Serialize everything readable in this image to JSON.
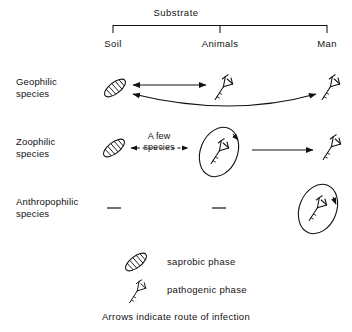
{
  "figure": {
    "title": "Substrate",
    "columns": [
      {
        "id": "soil",
        "label": "Soil"
      },
      {
        "id": "animals",
        "label": "Animals"
      },
      {
        "id": "man",
        "label": "Man"
      }
    ],
    "rows": [
      {
        "id": "geophilic",
        "label": "Geophilic\nspecies",
        "cells": [
          {
            "column": "soil",
            "icon": "saprobic-phase-icon"
          },
          {
            "column": "animals",
            "icon": "pathogenic-phase-icon"
          },
          {
            "column": "man",
            "icon": "pathogenic-phase-icon"
          }
        ],
        "arrows": [
          {
            "from": "soil",
            "to": "animals",
            "style": "solid",
            "heads": "both",
            "shape": "straight"
          },
          {
            "from": "soil",
            "to": "man",
            "style": "solid",
            "heads": "both",
            "shape": "curved"
          }
        ]
      },
      {
        "id": "zoophilic",
        "label": "Zoophilic\nspecies",
        "cells": [
          {
            "column": "soil",
            "icon": "saprobic-phase-icon"
          },
          {
            "column": "animals",
            "icon": "pathogenic-phase-icon",
            "enclosed": true,
            "cycle_arrow": true
          },
          {
            "column": "man",
            "icon": "pathogenic-phase-icon"
          }
        ],
        "arrows": [
          {
            "from": "soil",
            "to": "animals",
            "style": "dashed",
            "heads": "both",
            "shape": "straight",
            "label": "A few\nspecies"
          },
          {
            "from": "animals",
            "to": "man",
            "style": "solid",
            "heads": "end",
            "shape": "straight"
          }
        ]
      },
      {
        "id": "anthropophilic",
        "label": "Anthropophilic\nspecies",
        "cells": [
          {
            "column": "soil",
            "icon": "dash-marker",
            "text": "—"
          },
          {
            "column": "animals",
            "icon": "dash-marker",
            "text": "—"
          },
          {
            "column": "man",
            "icon": "pathogenic-phase-icon",
            "enclosed": true,
            "cycle_arrow": true
          }
        ],
        "arrows": []
      }
    ],
    "inline_labels": {
      "a_few_species_line1": "A few",
      "a_few_species_line2": "species"
    },
    "legend": [
      {
        "icon": "saprobic-phase-icon",
        "label": "saprobic phase"
      },
      {
        "icon": "pathogenic-phase-icon",
        "label": "pathogenic phase"
      }
    ],
    "caption": "Arrows indicate route of infection",
    "colors": {
      "ink": "#111111",
      "background": "#ffffff"
    }
  }
}
